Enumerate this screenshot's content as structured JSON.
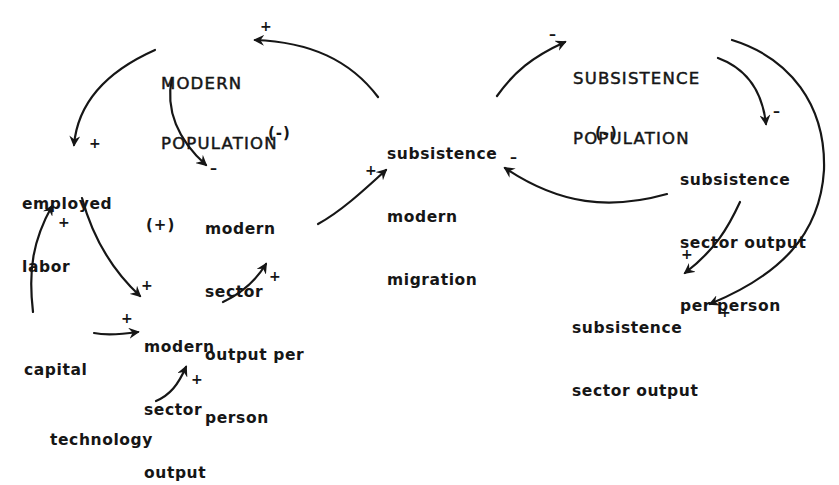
{
  "diagram": {
    "type": "causal-loop-diagram",
    "nodes": {
      "modern_population": {
        "lines": [
          "MODERN",
          "POPULATION"
        ]
      },
      "subsistence_population": {
        "lines": [
          "SUBSISTENCE",
          "POPULATION"
        ]
      },
      "employed_labor": {
        "lines": [
          "employed",
          "labor"
        ]
      },
      "modern_sector_output_per_person": {
        "lines": [
          "modern",
          "sector",
          "output per",
          "person"
        ]
      },
      "migration": {
        "lines": [
          "subsistence",
          "modern",
          "migration"
        ]
      },
      "subsistence_output_per_person": {
        "lines": [
          "subsistence",
          "sector output",
          "per person"
        ]
      },
      "modern_sector_output": {
        "lines": [
          "modern",
          "sector",
          "output"
        ]
      },
      "subsistence_sector_output": {
        "lines": [
          "subsistence",
          "sector output"
        ]
      },
      "capital": {
        "lines": [
          "capital"
        ]
      },
      "technology": {
        "lines": [
          "technology"
        ]
      }
    },
    "loops": {
      "left_negative": "(-)",
      "left_positive": "(+)",
      "right_negative": "(-)"
    },
    "links": [
      {
        "from": "subsistence modern migration",
        "to": "MODERN POPULATION",
        "sign": "+"
      },
      {
        "from": "MODERN POPULATION",
        "to": "employed labor",
        "sign": "+"
      },
      {
        "from": "MODERN POPULATION",
        "to": "modern sector output per person",
        "sign": "-"
      },
      {
        "from": "modern sector output per person",
        "to": "subsistence modern migration",
        "sign": "+"
      },
      {
        "from": "employed labor",
        "to": "modern sector output",
        "sign": "+"
      },
      {
        "from": "capital",
        "to": "employed labor",
        "sign": "+"
      },
      {
        "from": "capital",
        "to": "modern sector output",
        "sign": "+"
      },
      {
        "from": "technology",
        "to": "modern sector output",
        "sign": "+"
      },
      {
        "from": "modern sector output",
        "to": "modern sector output per person",
        "sign": "+"
      },
      {
        "from": "subsistence modern migration",
        "to": "SUBSISTENCE POPULATION",
        "sign": "-"
      },
      {
        "from": "SUBSISTENCE POPULATION",
        "to": "subsistence sector output per person",
        "sign": "-"
      },
      {
        "from": "subsistence sector output per person",
        "to": "subsistence modern migration",
        "sign": "-"
      },
      {
        "from": "subsistence sector output per person",
        "to": "subsistence sector output",
        "sign": "+"
      },
      {
        "from": "SUBSISTENCE POPULATION",
        "to": "subsistence sector output",
        "sign": "+"
      }
    ],
    "signs": {
      "plus": "+",
      "minus": "–"
    },
    "colors": {
      "ink": "#161616",
      "background": "#ffffff"
    }
  }
}
